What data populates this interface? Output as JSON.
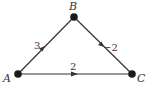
{
  "diagram": {
    "type": "directed-weighted-graph",
    "nodes": [
      {
        "id": "A",
        "label": "A",
        "x": 18,
        "y": 74
      },
      {
        "id": "B",
        "label": "B",
        "x": 74,
        "y": 17
      },
      {
        "id": "C",
        "label": "C",
        "x": 132,
        "y": 74
      }
    ],
    "edges": [
      {
        "from": "A",
        "to": "B",
        "weight": "3"
      },
      {
        "from": "B",
        "to": "C",
        "weight": "−2"
      },
      {
        "from": "A",
        "to": "C",
        "weight": "2"
      }
    ]
  },
  "colors": {
    "edge": "#333333",
    "node": "#1a1a1a",
    "text": "#333333"
  }
}
